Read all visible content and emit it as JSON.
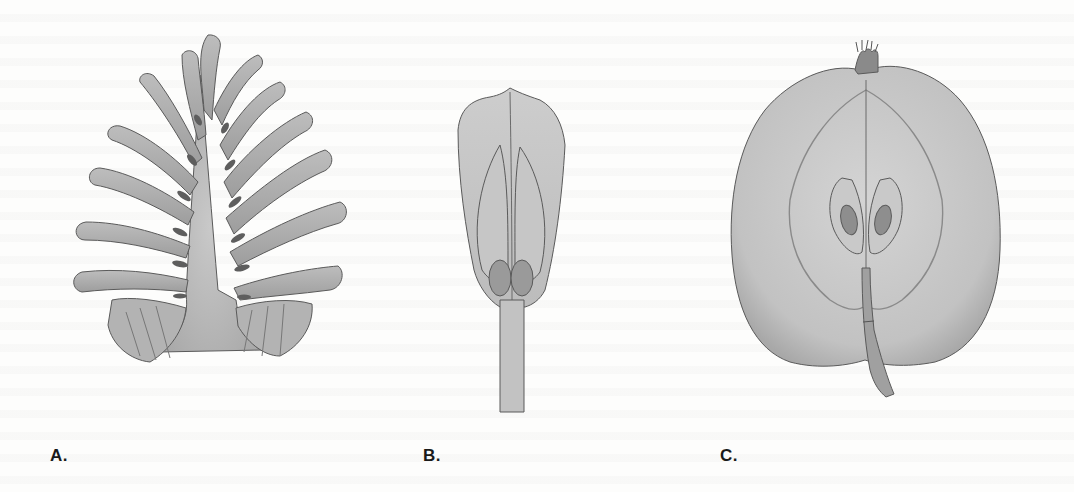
{
  "figure": {
    "panels": [
      {
        "id": "A",
        "label": "A.",
        "subject": "cone-scale-illustration"
      },
      {
        "id": "B",
        "label": "B.",
        "subject": "floral-structure-illustration"
      },
      {
        "id": "C",
        "label": "C.",
        "subject": "apple-cross-section-illustration"
      }
    ],
    "colors": {
      "paper": "#fdfdfc",
      "fill_light": "#cfcfcf",
      "fill_mid": "#b5b5b5",
      "fill_dark": "#6e6e6e",
      "outline": "#555555",
      "label_text": "#1a1a1a"
    }
  }
}
